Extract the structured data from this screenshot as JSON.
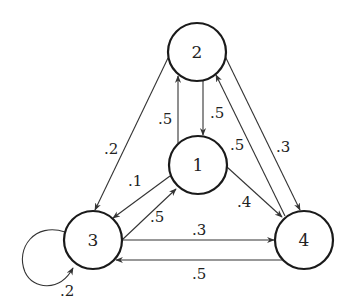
{
  "diagram": {
    "type": "markov-chain-state-graph",
    "nodes": [
      {
        "id": "1",
        "label": "1",
        "cx": 198,
        "cy": 165
      },
      {
        "id": "2",
        "label": "2",
        "cx": 197,
        "cy": 52
      },
      {
        "id": "3",
        "label": "3",
        "cx": 93,
        "cy": 240
      },
      {
        "id": "4",
        "label": "4",
        "cx": 304,
        "cy": 240
      }
    ],
    "edges": [
      {
        "from": "2",
        "to": "1",
        "label": ".5"
      },
      {
        "from": "1",
        "to": "2",
        "label": ".5"
      },
      {
        "from": "2",
        "to": "3",
        "label": ".2"
      },
      {
        "from": "2",
        "to": "4",
        "label": ".3"
      },
      {
        "from": "4",
        "to": "2",
        "label": ".5"
      },
      {
        "from": "1",
        "to": "3",
        "label": ".1"
      },
      {
        "from": "3",
        "to": "1",
        "label": ".5"
      },
      {
        "from": "1",
        "to": "4",
        "label": ".4"
      },
      {
        "from": "3",
        "to": "4",
        "label": ".3"
      },
      {
        "from": "4",
        "to": "3",
        "label": ".5"
      },
      {
        "from": "3",
        "to": "3",
        "label": ".2"
      }
    ]
  },
  "labels": {
    "n1": "1",
    "n2": "2",
    "n3": "3",
    "n4": "4",
    "e21": ".5",
    "e12": ".5",
    "e23": ".2",
    "e24": ".3",
    "e42": ".5",
    "e13": ".1",
    "e31": ".5",
    "e14": ".4",
    "e34": ".3",
    "e43": ".5",
    "e33": ".2"
  }
}
